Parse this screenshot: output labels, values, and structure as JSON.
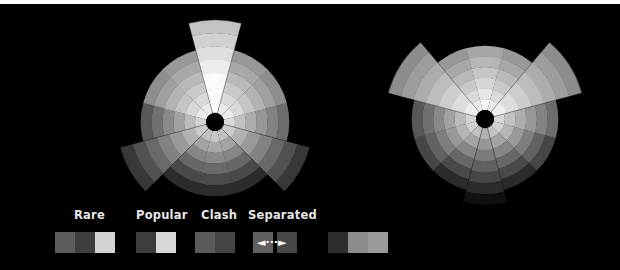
{
  "legend": {
    "labels": [
      {
        "text": "Rare",
        "x": 74
      },
      {
        "text": "Popular",
        "x": 136
      },
      {
        "text": "Clash",
        "x": 201
      },
      {
        "text": "Separated",
        "x": 248
      }
    ],
    "swatches": [
      {
        "group": "rare",
        "x": 55,
        "w": 20,
        "color": "#5c5c5c"
      },
      {
        "group": "rare",
        "x": 75,
        "w": 20,
        "color": "#3e3e3e"
      },
      {
        "group": "rare",
        "x": 95,
        "w": 20,
        "color": "#d4d4d4"
      },
      {
        "group": "popular",
        "x": 136,
        "w": 20,
        "color": "#3c3c3c"
      },
      {
        "group": "popular",
        "x": 156,
        "w": 20,
        "color": "#d8d8d8"
      },
      {
        "group": "clash",
        "x": 195,
        "w": 20,
        "color": "#5a5a5a"
      },
      {
        "group": "clash",
        "x": 215,
        "w": 20,
        "color": "#444444"
      },
      {
        "group": "separated",
        "x": 253,
        "w": 20,
        "color": "#606060"
      },
      {
        "group": "separated",
        "x": 277,
        "w": 20,
        "color": "#484848"
      },
      {
        "group": "extra",
        "x": 328,
        "w": 20,
        "color": "#2e2e2e"
      },
      {
        "group": "extra",
        "x": 348,
        "w": 20,
        "color": "#8c8c8c"
      },
      {
        "group": "extra",
        "x": 368,
        "w": 20,
        "color": "#9a9a9a"
      }
    ],
    "separated_arrow": "◄···►"
  },
  "wheels": [
    {
      "name": "left-wheel",
      "cx": 215,
      "cy": 122,
      "base_radius": 74,
      "rings": 6,
      "hole_radius": 9,
      "extended": [
        {
          "start": -105,
          "end": -75,
          "radius": 102,
          "boost": 30
        },
        {
          "start": 135,
          "end": 165,
          "radius": 98,
          "boost": -10
        },
        {
          "start": 15,
          "end": 45,
          "radius": 98,
          "boost": -10
        }
      ]
    },
    {
      "name": "right-wheel",
      "cx": 485,
      "cy": 119,
      "base_radius": 73,
      "rings": 6,
      "hole_radius": 9,
      "extended": [
        {
          "start": -165,
          "end": -130,
          "radius": 100,
          "boost": 0
        },
        {
          "start": -50,
          "end": -15,
          "radius": 100,
          "boost": 0
        },
        {
          "start": 75,
          "end": 105,
          "radius": 86,
          "boost": -25
        }
      ]
    }
  ]
}
